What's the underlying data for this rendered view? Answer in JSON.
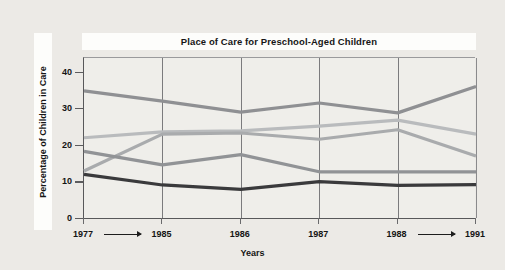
{
  "chart_data": {
    "type": "line",
    "title": "Place of Care for Preschool-Aged Children",
    "xlabel": "Years",
    "ylabel": "Percentage of Children in Care",
    "x": [
      "1977",
      "1985",
      "1986",
      "1987",
      "1988",
      "1991"
    ],
    "xtick_labels": [
      "1977",
      "1985",
      "1986",
      "1987",
      "1988",
      "1991"
    ],
    "xtick_arrows": [
      "1977-to-1985",
      "1988-to-1991"
    ],
    "ytick_labels": [
      "0",
      "10",
      "20",
      "30",
      "40"
    ],
    "ytick_values": [
      0,
      10,
      20,
      30,
      40
    ],
    "ylim": [
      0,
      44
    ],
    "grid": "vertical",
    "legend": "none",
    "series": [
      {
        "name": "series-1-care-in-childs-home",
        "color": "#8f9093",
        "values": [
          35.0,
          32.2,
          29.2,
          31.7,
          29.0,
          36.2
        ]
      },
      {
        "name": "series-2-care-in-another-home",
        "color": "#b9bbbd",
        "values": [
          22.2,
          23.8,
          24.1,
          25.4,
          27.0,
          23.2
        ]
      },
      {
        "name": "series-3-organized-child-care-facility",
        "color": "#a9abad",
        "values": [
          13.1,
          23.2,
          23.5,
          21.8,
          24.4,
          17.2
        ]
      },
      {
        "name": "series-4-care-by-parent",
        "color": "#919396",
        "values": [
          18.5,
          14.8,
          17.6,
          12.9,
          12.9,
          12.9
        ]
      },
      {
        "name": "series-5-other-arrangements",
        "color": "#3a3a3c",
        "values": [
          12.2,
          9.3,
          8.1,
          10.2,
          9.2,
          9.4
        ]
      }
    ]
  },
  "colors": {
    "page_background": "#eceae6",
    "plot_background": "#efeeea",
    "axis": "#58585a",
    "gridline": "#7b7b7d",
    "title_band": "#fdfdfb",
    "text": "#141414"
  }
}
